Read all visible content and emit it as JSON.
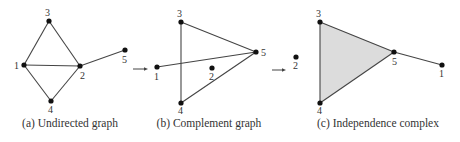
{
  "figure": {
    "panels": [
      {
        "id": "a",
        "caption": "(a) Undirected graph",
        "nodes": [
          {
            "id": "1",
            "x": 24,
            "y": 65,
            "lx": 14,
            "ly": 69
          },
          {
            "id": "2",
            "x": 80,
            "y": 66,
            "lx": 80,
            "ly": 79
          },
          {
            "id": "3",
            "x": 49,
            "y": 21,
            "lx": 45,
            "ly": 16
          },
          {
            "id": "4",
            "x": 51,
            "y": 101,
            "lx": 48,
            "ly": 113
          },
          {
            "id": "5",
            "x": 125,
            "y": 50,
            "lx": 122,
            "ly": 63
          }
        ],
        "edges": [
          [
            "1",
            "3"
          ],
          [
            "3",
            "2"
          ],
          [
            "1",
            "2"
          ],
          [
            "1",
            "4"
          ],
          [
            "4",
            "2"
          ],
          [
            "2",
            "5"
          ]
        ]
      },
      {
        "id": "b",
        "caption": "(b) Complement graph",
        "nodes": [
          {
            "id": "1",
            "x": 157,
            "y": 67,
            "lx": 154,
            "ly": 80
          },
          {
            "id": "2",
            "x": 212,
            "y": 68,
            "lx": 209,
            "ly": 80
          },
          {
            "id": "3",
            "x": 181,
            "y": 22,
            "lx": 177,
            "ly": 17
          },
          {
            "id": "4",
            "x": 181,
            "y": 103,
            "lx": 178,
            "ly": 114
          },
          {
            "id": "5",
            "x": 256,
            "y": 52,
            "lx": 261,
            "ly": 56
          }
        ],
        "edges": [
          [
            "3",
            "4"
          ],
          [
            "3",
            "5"
          ],
          [
            "1",
            "5"
          ],
          [
            "4",
            "5"
          ]
        ]
      },
      {
        "id": "c",
        "caption": "(c) Independence complex",
        "nodes": [
          {
            "id": "1",
            "x": 442,
            "y": 65,
            "lx": 439,
            "ly": 77
          },
          {
            "id": "2",
            "x": 296,
            "y": 57,
            "lx": 293,
            "ly": 69
          },
          {
            "id": "3",
            "x": 320,
            "y": 22,
            "lx": 316,
            "ly": 17
          },
          {
            "id": "4",
            "x": 320,
            "y": 103,
            "lx": 317,
            "ly": 114
          },
          {
            "id": "5",
            "x": 394,
            "y": 52,
            "lx": 392,
            "ly": 65
          }
        ],
        "edges": [
          [
            "3",
            "4"
          ],
          [
            "3",
            "5"
          ],
          [
            "4",
            "5"
          ],
          [
            "5",
            "1"
          ]
        ],
        "filled_faces": [
          [
            "3",
            "5",
            "4"
          ]
        ],
        "face_color": "#dcdcdc"
      }
    ],
    "arrows": [
      {
        "from": "a",
        "to": "b",
        "x1": 133,
        "x2": 148,
        "y": 69
      },
      {
        "from": "b",
        "to": "c",
        "x1": 272,
        "x2": 286,
        "y": 70
      }
    ],
    "captions_layout": [
      {
        "x": 70,
        "y": 127
      },
      {
        "x": 209,
        "y": 127
      },
      {
        "x": 378,
        "y": 127
      }
    ]
  }
}
